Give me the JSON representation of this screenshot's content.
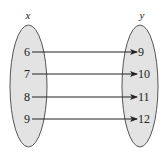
{
  "diagram": {
    "type": "mapping",
    "domain_set": {
      "label": "x",
      "values": [
        "6",
        "7",
        "8",
        "9"
      ]
    },
    "range_set": {
      "label": "y",
      "values": [
        "9",
        "10",
        "11",
        "12"
      ]
    },
    "mappings": [
      {
        "from": "6",
        "to": "9"
      },
      {
        "from": "7",
        "to": "10"
      },
      {
        "from": "8",
        "to": "11"
      },
      {
        "from": "9",
        "to": "12"
      }
    ],
    "colors": {
      "ellipse_fill": "#e3e3e3",
      "ellipse_stroke": "#555555",
      "arrow": "#222222",
      "text": "#222222"
    }
  }
}
